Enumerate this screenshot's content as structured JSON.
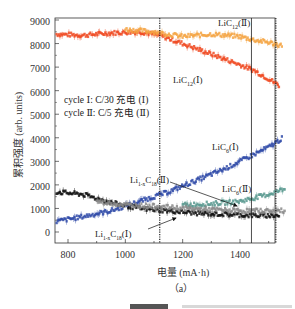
{
  "chart_data": {
    "type": "scatter",
    "title": "",
    "subtitle": "(a)",
    "xlabel": "电量 (mA·h)",
    "ylabel": "累积强度 (arb. units)",
    "xlim": [
      755,
      1560
    ],
    "ylim": [
      -300,
      9100
    ],
    "xticks": [
      800,
      1000,
      1200,
      1400
    ],
    "yticks": [
      0,
      1000,
      2000,
      3000,
      4000,
      5000,
      6000,
      7000,
      8000,
      9000
    ],
    "grid": false,
    "legend": {
      "position": "inside-left",
      "entries": [
        "cycle Ⅰ: C/30 充电 (Ⅰ)",
        "cycle Ⅱ: C/5 充电 (Ⅱ)"
      ]
    },
    "vertical_lines": [
      {
        "x": 1120,
        "style": "dotted"
      },
      {
        "x": 1440,
        "style": "solid"
      },
      {
        "x": 1525,
        "style": "dotted"
      }
    ],
    "series": [
      {
        "name": "LiC12 (Ⅰ)",
        "color": "#f04a22",
        "x": [
          760,
          850,
          950,
          1050,
          1120,
          1200,
          1300,
          1400,
          1450,
          1500,
          1540
        ],
        "y": [
          8400,
          8350,
          8450,
          8500,
          8350,
          8000,
          7550,
          7100,
          6850,
          6500,
          6200
        ]
      },
      {
        "name": "LiC12 (Ⅱ)",
        "color": "#f5a443",
        "x": [
          1000,
          1100,
          1200,
          1300,
          1400,
          1450,
          1500,
          1550
        ],
        "y": [
          8600,
          8500,
          8300,
          8400,
          8300,
          8150,
          8050,
          7900
        ]
      },
      {
        "name": "LiC6 (Ⅰ)",
        "color": "#2f4aa8",
        "x": [
          760,
          850,
          950,
          1050,
          1150,
          1250,
          1350,
          1450,
          1500,
          1550
        ],
        "y": [
          450,
          650,
          900,
          1300,
          1700,
          2200,
          2700,
          3300,
          3600,
          4000
        ]
      },
      {
        "name": "LiC6 (Ⅱ)",
        "color": "#5a9a90",
        "x": [
          1200,
          1300,
          1400,
          1450,
          1500,
          1560
        ],
        "y": [
          1150,
          1200,
          1300,
          1450,
          1600,
          1850
        ]
      },
      {
        "name": "Li1-xC18 (Ⅰ)",
        "color": "#111111",
        "x": [
          760,
          850,
          950,
          1050,
          1150,
          1250,
          1350,
          1450,
          1540
        ],
        "y": [
          1700,
          1600,
          1250,
          1000,
          900,
          800,
          750,
          700,
          700
        ]
      },
      {
        "name": "Li1-xC18 (Ⅱ)",
        "color": "#8a8a8a",
        "x": [
          900,
          1000,
          1100,
          1200,
          1300,
          1400,
          1500,
          1560
        ],
        "y": [
          1300,
          1150,
          1100,
          1000,
          950,
          900,
          900,
          900
        ]
      }
    ],
    "annotations": [
      {
        "text": "LiC12(Ⅱ)",
        "x": 1390,
        "y": 8950
      },
      {
        "text": "LiC12(Ⅰ)",
        "x": 1190,
        "y": 7050
      },
      {
        "text": "LiC6(Ⅰ)",
        "x": 1320,
        "y": 3100
      },
      {
        "text": "LiC6(Ⅱ)",
        "x": 1380,
        "y": 1900
      },
      {
        "text": "Li1-xC18(Ⅱ)",
        "x": 1040,
        "y": 2200,
        "arrow_to": [
          1410,
          1000
        ]
      },
      {
        "text": "Li1-xC18(Ⅰ)",
        "x": 880,
        "y": 40,
        "arrow_to": [
          1170,
          820
        ]
      }
    ]
  },
  "labels": {
    "yticks": [
      "0",
      "1000",
      "2000",
      "3000",
      "4000",
      "5000",
      "6000",
      "7000",
      "8000",
      "9000"
    ],
    "xticks": [
      "800",
      "1000",
      "1200",
      "1400"
    ],
    "xlabel": "电量 (mA·h)",
    "ylabel": "累积强度 (arb. units)",
    "subtitle": "（a）",
    "legend1": "cycle Ⅰ: C/30 充电 (Ⅰ)",
    "legend2": "cycle Ⅱ: C/5 充电 (Ⅱ)",
    "anno_lic12_2_main": "LiC",
    "anno_lic12_2_sub": "12",
    "anno_lic12_2_tail": "(Ⅱ)",
    "anno_lic12_1_main": "LiC",
    "anno_lic12_1_sub": "12",
    "anno_lic12_1_tail": "(Ⅰ)",
    "anno_lic6_1_main": "LiC",
    "anno_lic6_1_sub": "6",
    "anno_lic6_1_tail": "(Ⅰ)",
    "anno_lic6_2_main": "LiC",
    "anno_lic6_2_sub": "6",
    "anno_lic6_2_tail": "(Ⅱ)",
    "anno_lic18_2_main": "Li",
    "anno_lic18_2_sub1": "1-x",
    "anno_lic18_2_mid": "C",
    "anno_lic18_2_sub2": "18",
    "anno_lic18_2_tail": "(Ⅱ)",
    "anno_lic18_1_main": "Li",
    "anno_lic18_1_sub1": "1-x",
    "anno_lic18_1_mid": "C",
    "anno_lic18_1_sub2": "18",
    "anno_lic18_1_tail": "(Ⅰ)"
  }
}
